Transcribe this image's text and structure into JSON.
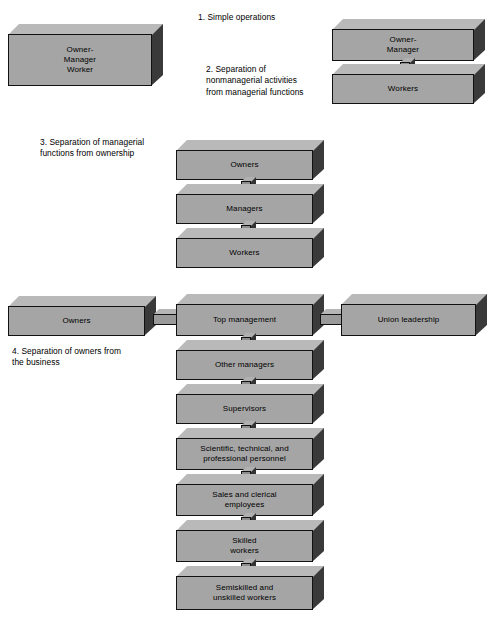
{
  "figure": {
    "background_color": "#ffffff",
    "block_face_color": "#a5a5a5",
    "block_top_color": "#b9b9b9",
    "block_side_color": "#3a3a3a",
    "outline_color": "#111111"
  },
  "captions": [
    {
      "id": "caption-1",
      "text": "1.  Simple operations"
    },
    {
      "id": "caption-2",
      "text": "2.  Separation of\nnonmanagerial activities\nfrom managerial functions"
    },
    {
      "id": "caption-3",
      "text": "3.  Separation of managerial\nfunctions from ownership"
    },
    {
      "id": "caption-4",
      "text": "4.  Separation of owners from\nthe business"
    }
  ],
  "stages": [
    {
      "id": "stage-1",
      "caption_ref": "1.  Simple operations",
      "blocks": [
        {
          "id": "block-owner-manager-worker",
          "label": "Owner-\nManager\nWorker"
        }
      ]
    },
    {
      "id": "stage-2",
      "caption_ref": "2.  Separation of nonmanagerial activities from managerial functions",
      "blocks": [
        {
          "id": "block-owner-manager",
          "label": "Owner-\nManager"
        },
        {
          "id": "block-workers-2",
          "label": "Workers"
        }
      ],
      "connectors": [
        {
          "from": "block-owner-manager",
          "to": "block-workers-2",
          "orientation": "vertical"
        }
      ]
    },
    {
      "id": "stage-3",
      "caption_ref": "3.  Separation of managerial functions from ownership",
      "blocks": [
        {
          "id": "block-owners-3",
          "label": "Owners"
        },
        {
          "id": "block-managers-3",
          "label": "Managers"
        },
        {
          "id": "block-workers-3",
          "label": "Workers"
        }
      ],
      "connectors": [
        {
          "from": "block-owners-3",
          "to": "block-managers-3",
          "orientation": "vertical"
        },
        {
          "from": "block-managers-3",
          "to": "block-workers-3",
          "orientation": "vertical"
        }
      ]
    },
    {
      "id": "stage-4",
      "caption_ref": "4.  Separation of owners from the business",
      "blocks": [
        {
          "id": "block-owners-4",
          "label": "Owners"
        },
        {
          "id": "block-top-management",
          "label": "Top management"
        },
        {
          "id": "block-union-leadership",
          "label": "Union leadership"
        },
        {
          "id": "block-other-managers",
          "label": "Other managers"
        },
        {
          "id": "block-supervisors",
          "label": "Supervisors"
        },
        {
          "id": "block-scientific",
          "label": "Scientific, technical, and\nprofessional personnel"
        },
        {
          "id": "block-sales-clerical",
          "label": "Sales and clerical\nemployees"
        },
        {
          "id": "block-skilled-workers",
          "label": "Skilled\nworkers"
        },
        {
          "id": "block-semiskilled",
          "label": "Semiskilled and\nunskilled workers"
        }
      ],
      "connectors": [
        {
          "from": "block-owners-4",
          "to": "block-top-management",
          "orientation": "horizontal"
        },
        {
          "from": "block-top-management",
          "to": "block-union-leadership",
          "orientation": "horizontal"
        },
        {
          "from": "block-top-management",
          "to": "block-other-managers",
          "orientation": "vertical"
        },
        {
          "from": "block-other-managers",
          "to": "block-supervisors",
          "orientation": "vertical"
        },
        {
          "from": "block-supervisors",
          "to": "block-scientific",
          "orientation": "vertical"
        },
        {
          "from": "block-scientific",
          "to": "block-sales-clerical",
          "orientation": "vertical"
        },
        {
          "from": "block-sales-clerical",
          "to": "block-skilled-workers",
          "orientation": "vertical"
        },
        {
          "from": "block-skilled-workers",
          "to": "block-semiskilled",
          "orientation": "vertical"
        }
      ]
    }
  ]
}
